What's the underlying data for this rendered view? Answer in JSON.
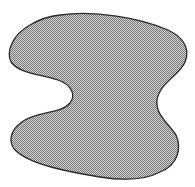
{
  "figure": {
    "fill_light": "#d2d2d2",
    "fill_dark": "#7a7a7a",
    "stroke": "#2a2a2a",
    "background": "#ffffff"
  }
}
